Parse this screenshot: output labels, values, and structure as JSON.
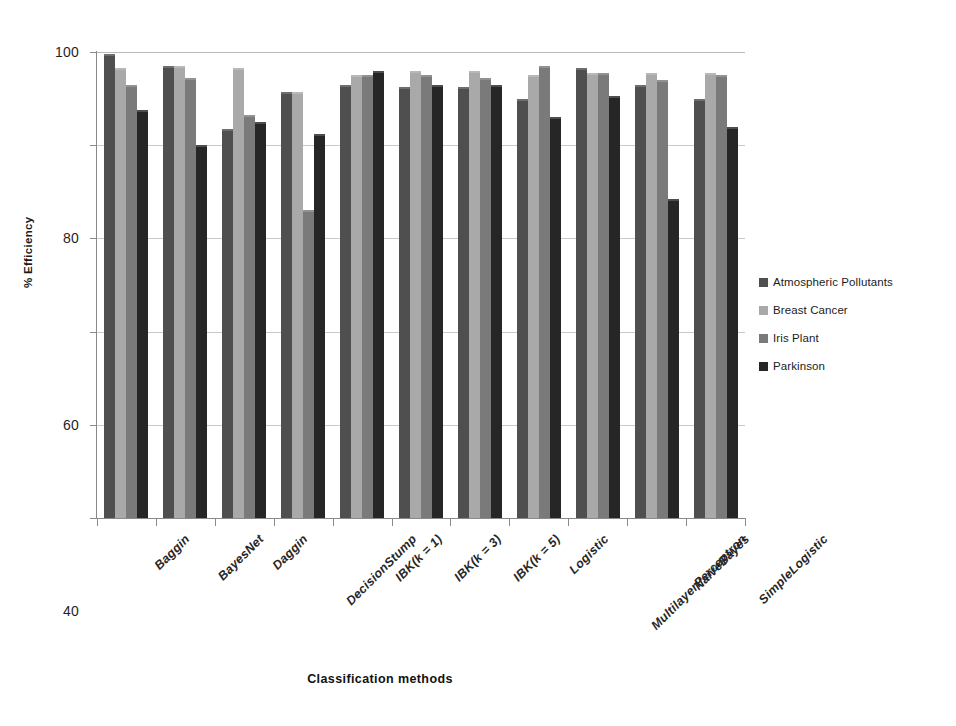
{
  "chart_data": {
    "type": "bar",
    "title": "",
    "xlabel": "Classification methods",
    "ylabel": "% Efficiency",
    "ylim": [
      0,
      100
    ],
    "yticks": [
      0,
      20,
      40,
      60,
      80,
      100
    ],
    "grid": true,
    "legend_position": "right",
    "categories": [
      "Baggin",
      "BayesNet",
      "Daggin",
      "DecisionStump",
      "IBK(k = 1)",
      "IBK(k = 3)",
      "IBK(k = 5)",
      "Logistic",
      "MultilayerPerceptron",
      "NaiveBayes",
      "SimpleLogistic"
    ],
    "series": [
      {
        "name": "Atmospheric Pollutants",
        "color": "#4f4f4f",
        "values": [
          99.5,
          97.0,
          83.5,
          91.5,
          93.0,
          92.5,
          92.5,
          90.0,
          96.5,
          93.0,
          90.0
        ]
      },
      {
        "name": "Breast Cancer",
        "color": "#a9a9a9",
        "values": [
          96.5,
          97.0,
          96.5,
          91.5,
          95.0,
          96.0,
          96.0,
          95.0,
          95.5,
          95.5,
          95.5
        ]
      },
      {
        "name": "Iris Plant",
        "color": "#7a7a7a",
        "values": [
          93.0,
          94.5,
          86.5,
          66.0,
          95.0,
          95.0,
          94.5,
          97.0,
          95.5,
          94.0,
          95.0
        ]
      },
      {
        "name": "Parkinson",
        "color": "#262626",
        "values": [
          87.5,
          80.0,
          85.0,
          82.5,
          96.0,
          93.0,
          93.0,
          86.0,
          90.5,
          68.5,
          84.0
        ]
      }
    ]
  },
  "axes": {
    "y_title": "% Efficiency",
    "x_title": "Classification methods"
  }
}
